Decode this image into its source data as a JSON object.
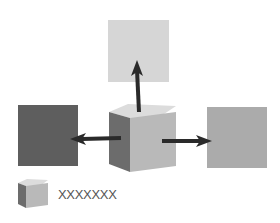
{
  "diagram": {
    "squares": {
      "top": {
        "color": "#d6d6d6"
      },
      "left": {
        "color": "#5e5e5e"
      },
      "right": {
        "color": "#ababab"
      }
    },
    "cube": {
      "top_color": "#dcdcdc",
      "front_color": "#b9b9b9",
      "side_color": "#6c6c6c"
    },
    "arrow_color": "#2a2a2a",
    "legend": {
      "label": "XXXXXXX"
    }
  }
}
